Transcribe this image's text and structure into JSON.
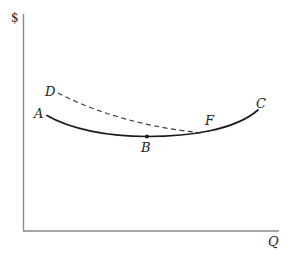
{
  "theme": {
    "background": "#ffffff",
    "axis_color": "#8a8a8a",
    "curve_color": "#1b1b1b",
    "dashed_color": "#3c3c3c",
    "label_color": "#222222"
  },
  "axes": {
    "y_label": "$",
    "x_label": "Q"
  },
  "labels": {
    "D": "D",
    "A": "A",
    "B": "B",
    "F": "F",
    "C": "C"
  },
  "curves": {
    "solid_ABC": {
      "description": "Solid U-shaped curve running from A down through minimum point B (marked with a dot), past F, rising to C",
      "path": "M 47,115.5 C 70,129 108,136.5 147,136.5 C 190,136.5 235,130 258,110",
      "labeled_points": [
        "A",
        "B",
        "F",
        "C"
      ]
    },
    "dashed_DF": {
      "description": "Dashed curve falling from D and merging tangentially with the solid curve just left of F",
      "path": "M 58,93 C 100,115 152,128 201,132.8",
      "labeled_points": [
        "D",
        "F"
      ]
    },
    "point_B_marker": {
      "x": 147,
      "y": 136.5,
      "radius": 2
    }
  }
}
